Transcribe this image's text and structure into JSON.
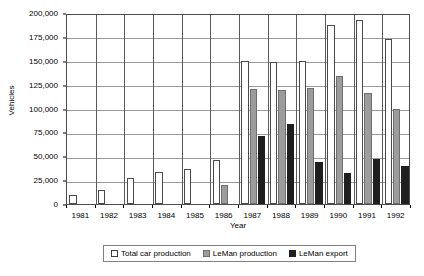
{
  "chart_data": {
    "type": "bar",
    "title": "",
    "xlabel": "Year",
    "ylabel": "Vehicles",
    "categories": [
      "1981",
      "1982",
      "1983",
      "1984",
      "1985",
      "1986",
      "1987",
      "1988",
      "1989",
      "1990",
      "1991",
      "1992"
    ],
    "ylim": [
      0,
      200000
    ],
    "yticks": [
      0,
      25000,
      50000,
      75000,
      100000,
      125000,
      150000,
      175000,
      200000
    ],
    "ytick_labels": [
      "0",
      "25,000",
      "50,000",
      "75,000",
      "100,000",
      "125,000",
      "150,000",
      "175,000",
      "200,000"
    ],
    "grid": true,
    "legend_position": "bottom",
    "series": [
      {
        "name": "Total car production",
        "color": "#ffffff",
        "edge_color": "#4a4a4a",
        "values": [
          9000,
          15000,
          27000,
          34000,
          37000,
          46000,
          150000,
          149000,
          149500,
          187500,
          193000,
          172500
        ]
      },
      {
        "name": "LeMan production",
        "color": "#9c9c9c",
        "edge_color": "#6f6f6f",
        "values": [
          0,
          0,
          0,
          0,
          0,
          20000,
          120000,
          119000,
          122000,
          134000,
          116000,
          100000
        ]
      },
      {
        "name": "LeMan export",
        "color": "#1f1f1f",
        "edge_color": "#1f1f1f",
        "values": [
          0,
          0,
          0,
          0,
          0,
          0,
          71000,
          84000,
          44000,
          33000,
          47000,
          40000
        ]
      }
    ]
  },
  "legend": {
    "items": [
      {
        "label": "Total car production",
        "swatch": "total"
      },
      {
        "label": "LeMan production",
        "swatch": "leman"
      },
      {
        "label": "LeMan export",
        "swatch": "export"
      }
    ]
  }
}
